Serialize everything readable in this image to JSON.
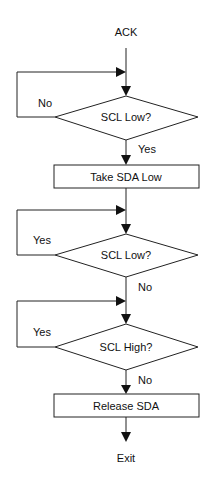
{
  "flowchart": {
    "start": "ACK",
    "decision1": {
      "label": "SCL Low?",
      "no": "No",
      "yes": "Yes"
    },
    "process1": "Take SDA Low",
    "decision2": {
      "label": "SCL Low?",
      "yes": "Yes",
      "no": "No"
    },
    "decision3": {
      "label": "SCL High?",
      "yes": "Yes",
      "no": "No"
    },
    "process2": "Release SDA",
    "end": "Exit"
  },
  "colors": {
    "line": "#222222",
    "background": "#ffffff",
    "text": "#111111"
  }
}
